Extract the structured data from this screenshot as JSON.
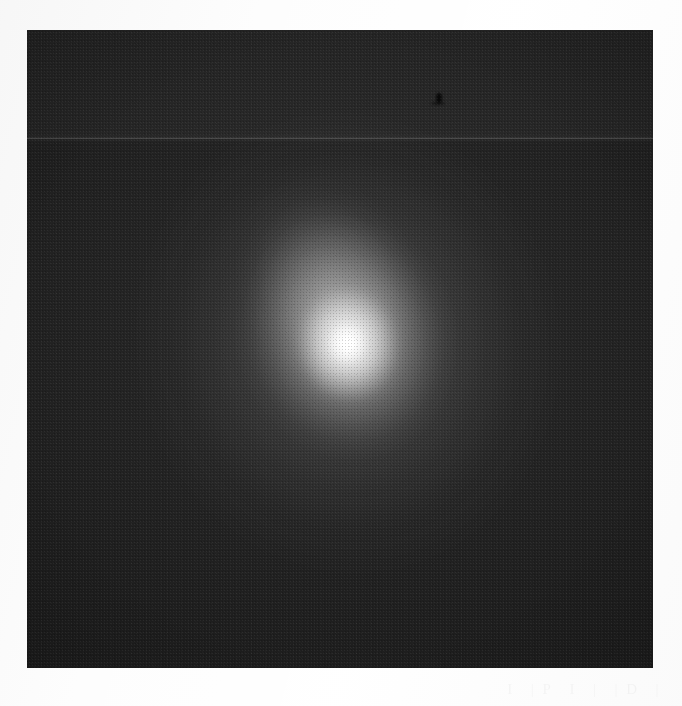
{
  "page": {
    "background_color": "#fdfdfd",
    "width": 682,
    "height": 706
  },
  "plate": {
    "label": "astronomical-plate-scan",
    "frame": {
      "x": 27,
      "y": 30,
      "width": 626,
      "height": 638,
      "background_color": "#141414",
      "sky_background_color": "#1e1e1e"
    },
    "object": {
      "name": "diffuse-bright-source",
      "center_x": 348,
      "center_y": 343,
      "core_color": "#ffffff",
      "halo_color": "#9a9a9a",
      "description": "saturated white nucleus surrounded by a smooth circular coma that fades into the dark sky background, slightly elongated toward the upper-left"
    },
    "artifacts": [
      {
        "name": "horizontal-scan-line",
        "y": 138,
        "color": "#3a3a3a",
        "description": "thin brighter horizontal line crossing the full width of the plate"
      },
      {
        "name": "upper-brightness-band",
        "y_start": 30,
        "y_end": 138,
        "description": "region above the scan line is marginally lighter than the rest of the field"
      },
      {
        "name": "emulsion-blemish",
        "x": 438,
        "y": 95,
        "color": "#000000",
        "description": "small dark speck near the top of the plate"
      },
      {
        "name": "column-banding",
        "description": "faint regular vertical striping from the scanner"
      }
    ]
  },
  "caption": {
    "name": "ghost-caption-artifact",
    "description": "extremely faint bleed-through text along the bottom margin, effectively illegible",
    "fragments": [
      "I",
      "| P",
      "I",
      "|",
      "| D",
      "|"
    ]
  }
}
